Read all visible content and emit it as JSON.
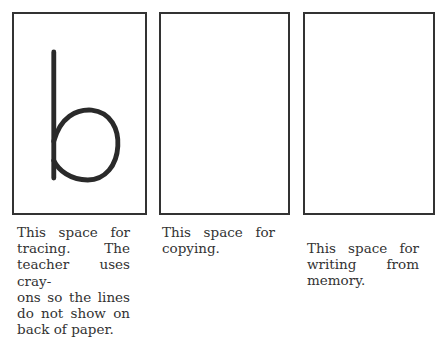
{
  "panels": [
    {
      "id": "tracing",
      "letter": "b",
      "caption_lines": [
        "This space for",
        "tracing. The",
        "teacher uses cray-",
        "ons so the lines",
        "do not show on",
        "back of paper."
      ]
    },
    {
      "id": "copying",
      "letter": "",
      "caption_lines": [
        "This space for",
        "copying."
      ]
    },
    {
      "id": "memory",
      "letter": "",
      "caption_lines": [
        "This space for",
        "writing from",
        "memory."
      ]
    }
  ],
  "colors": {
    "ink": "#333333",
    "paper": "#ffffff"
  }
}
